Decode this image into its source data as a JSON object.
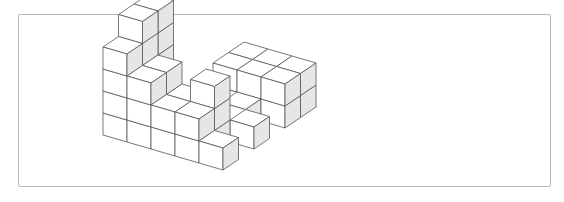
{
  "figure": {
    "face_colors": {
      "top": "#ffffff",
      "left": "#ffffff",
      "right": "#e6e6e6",
      "edge": "#555555",
      "frame": "#b8b8b8"
    },
    "projection": {
      "origin": [
        223,
        170
      ],
      "axis_a": [
        15.5,
        -10.5
      ],
      "axis_b": [
        -24,
        -7
      ],
      "axis_up": [
        0,
        -22
      ]
    },
    "cubes": [
      [
        1,
        4,
        0
      ],
      [
        1,
        4,
        1
      ],
      [
        1,
        4,
        2
      ],
      [
        1,
        4,
        3
      ],
      [
        1,
        4,
        4
      ],
      [
        2,
        4,
        0
      ],
      [
        2,
        4,
        1
      ],
      [
        2,
        4,
        2
      ],
      [
        2,
        4,
        3
      ],
      [
        2,
        4,
        4
      ],
      [
        0,
        4,
        0
      ],
      [
        0,
        4,
        1
      ],
      [
        0,
        4,
        2
      ],
      [
        0,
        4,
        3
      ],
      [
        0,
        3,
        0
      ],
      [
        0,
        3,
        1
      ],
      [
        0,
        3,
        2
      ],
      [
        0,
        2,
        0
      ],
      [
        0,
        2,
        1
      ],
      [
        0,
        1,
        0
      ],
      [
        0,
        1,
        1
      ],
      [
        1,
        3,
        0
      ],
      [
        1,
        3,
        1
      ],
      [
        1,
        3,
        2
      ],
      [
        1,
        2,
        0
      ],
      [
        1,
        2,
        1
      ],
      [
        4,
        2,
        0
      ],
      [
        4,
        2,
        1
      ],
      [
        3,
        1,
        0
      ],
      [
        5,
        2,
        0
      ],
      [
        5,
        2,
        1
      ],
      [
        4,
        0,
        0
      ],
      [
        4,
        0,
        1
      ],
      [
        5,
        0,
        0
      ],
      [
        5,
        0,
        1
      ],
      [
        4,
        1,
        0
      ],
      [
        4,
        1,
        1
      ],
      [
        5,
        1,
        0
      ],
      [
        5,
        1,
        1
      ],
      [
        2,
        0,
        0
      ],
      [
        1,
        1,
        0
      ],
      [
        1,
        1,
        1
      ],
      [
        1,
        1,
        2
      ],
      [
        0,
        0,
        0
      ]
    ]
  }
}
